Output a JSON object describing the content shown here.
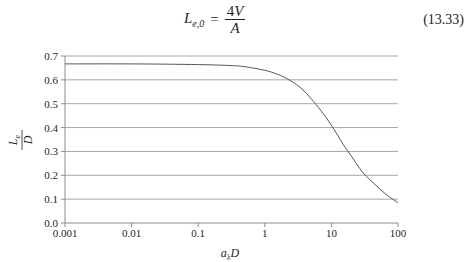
{
  "equation": {
    "lhs_main": "L",
    "lhs_sub": "e,0",
    "equals": "=",
    "numerator_coef": "4",
    "numerator_var": "V",
    "denominator": "A",
    "number": "(13.33)"
  },
  "colors": {
    "curve": "#555555",
    "gridline": "#a6a6a6",
    "axis": "#8c8c8c",
    "text": "#231f20"
  },
  "chart_data": {
    "type": "line",
    "title": "",
    "xlabel": "a_λ D",
    "ylabel": "L_e / D",
    "xscale": "log",
    "xlim": [
      0.001,
      100
    ],
    "ylim": [
      0.0,
      0.7
    ],
    "grid": {
      "horizontal": true,
      "vertical": false
    },
    "legend": null,
    "x_tick_labels": [
      "0.001",
      "0.01",
      "0.1",
      "1",
      "10",
      "100"
    ],
    "y_tick_labels": [
      "0.0",
      "0.1",
      "0.2",
      "0.3",
      "0.4",
      "0.5",
      "0.6",
      "0.7"
    ],
    "series": [
      {
        "name": "L_e/D",
        "x": [
          0.001,
          0.01,
          0.1,
          0.3,
          0.5,
          1,
          1.5,
          2,
          3,
          4,
          5,
          7,
          10,
          15,
          20,
          30,
          50,
          70,
          100
        ],
        "values": [
          0.667,
          0.667,
          0.664,
          0.66,
          0.655,
          0.64,
          0.625,
          0.61,
          0.58,
          0.55,
          0.52,
          0.47,
          0.41,
          0.33,
          0.28,
          0.21,
          0.15,
          0.115,
          0.085
        ]
      }
    ]
  }
}
